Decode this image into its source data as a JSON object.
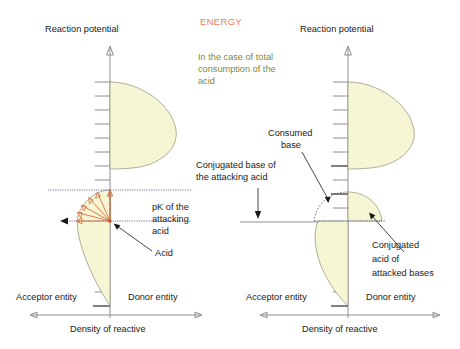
{
  "figure": {
    "title": "ENERGY",
    "title_color": "#ef7d5a",
    "note": {
      "line1": "In the case of total",
      "line2": "consumption of the",
      "line3": "acid",
      "color": "#7a8c3f"
    },
    "lobe_fill": "#f6f6d4",
    "lobe_stroke": "#9a9a86",
    "fan_color": "#d4693a",
    "panels": [
      {
        "id": "left-panel",
        "y_axis_label": "Reaction potential",
        "x_axis_label": "Density of reactive",
        "left_region_label": "Acceptor entity",
        "right_region_label": "Donor entity",
        "annotations": [
          {
            "id": "pk-label",
            "lines": [
              "pK of the",
              "attacking",
              "acid"
            ]
          },
          {
            "id": "acid-label",
            "lines": [
              "Acid"
            ]
          }
        ]
      },
      {
        "id": "right-panel",
        "y_axis_label": "Reaction potential",
        "x_axis_label": "Density of reactive",
        "left_region_label": "Acceptor entity",
        "right_region_label": "Donor entity",
        "annotations": [
          {
            "id": "consumed-base-label",
            "lines": [
              "Consumed",
              "base"
            ]
          },
          {
            "id": "conjugated-base-label",
            "lines": [
              "Conjugated base of",
              "the attacking acid"
            ]
          },
          {
            "id": "conjugated-acid-label",
            "lines": [
              "Conjugated",
              "acid of",
              "attacked bases"
            ]
          }
        ]
      }
    ]
  }
}
